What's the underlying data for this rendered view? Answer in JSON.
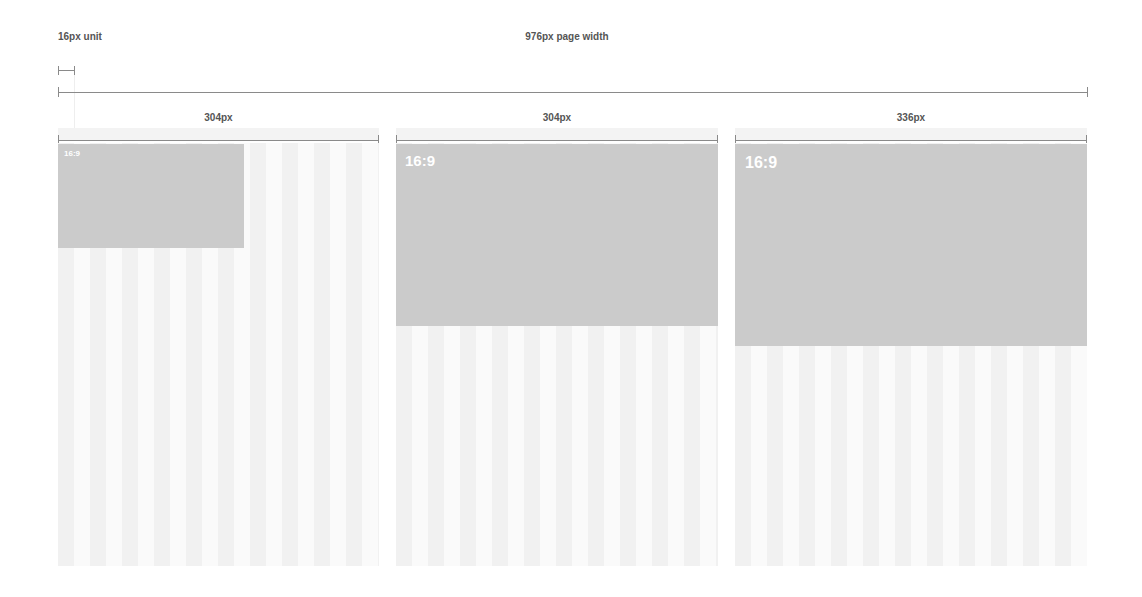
{
  "header": {
    "unit_label": "16px unit",
    "page_width_label": "976px page width"
  },
  "columns": [
    {
      "width_label": "304px",
      "box_label": "16:9"
    },
    {
      "width_label": "304px",
      "box_label": "16:9"
    },
    {
      "width_label": "336px",
      "box_label": "16:9"
    }
  ],
  "colors": {
    "box": "#cbcbcb",
    "stripe_dark": "#f1f1f1",
    "stripe_light": "#fafafa",
    "line": "#8a8a8a",
    "label": "#555555"
  }
}
